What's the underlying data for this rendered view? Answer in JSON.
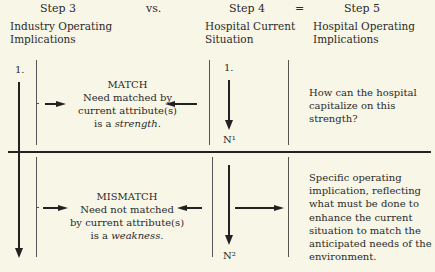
{
  "header": {
    "step3": "Step 3",
    "vs": "vs.",
    "step4": "Step 4",
    "equals": "=",
    "step5": "Step 5",
    "col1_title_line1": "Industry Operating",
    "col1_title_line2": "Implications",
    "col2_title_line1": "Hospital Current",
    "col2_title_line2": "Situation",
    "col3_title_line1": "Hospital Operating",
    "col3_title_line2": "Implications"
  },
  "top": {
    "industry_label": "1.",
    "hospital_label": "1.",
    "hospital_end_label": "N¹",
    "center_title": "MATCH",
    "center_line1": "Need matched by",
    "center_line2": "current attribute(s)",
    "center_line3_prefix": "is a ",
    "center_line3_em": "strength",
    "center_line3_suffix": ".",
    "implication_lines": [
      "How can the hospital",
      "capitalize on this",
      "strength?"
    ]
  },
  "bottom": {
    "hospital_end_label": "N²",
    "center_title": "MISMATCH",
    "center_line1": "Need not matched",
    "center_line2": "by current attribute(s)",
    "center_line3_prefix": "is a ",
    "center_line3_em": "weakness",
    "center_line3_suffix": ".",
    "implication_lines": [
      "Specific operating",
      "implication, reflecting",
      "what must be done to",
      "enhance the current",
      "situation to match the",
      "anticipated needs of the",
      "environment."
    ]
  }
}
